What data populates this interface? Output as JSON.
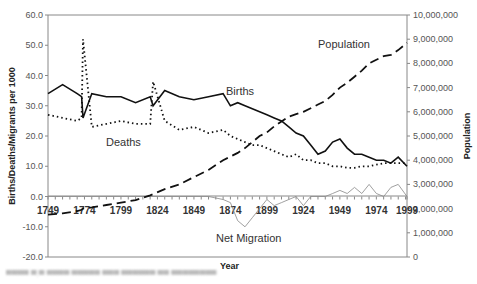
{
  "chart_data": {
    "type": "line",
    "title": "",
    "xlabel": "Year",
    "ylabel": "Births/Deaths/Migrants per 1000",
    "y2label": "Population",
    "xlim": [
      1749,
      1995
    ],
    "ylim": [
      -20,
      60
    ],
    "y2lim": [
      0,
      10000000
    ],
    "grid": false,
    "legend": "none (inline annotations)",
    "x_tick_labels": [
      "1749",
      "1774",
      "1799",
      "1824",
      "1849",
      "1874",
      "1899",
      "1924",
      "1949",
      "1974",
      "1999"
    ],
    "y_tick_labels": [
      "60.0",
      "50.0",
      "40.0",
      "30.0",
      "20.0",
      "10.0",
      "0.0",
      "-10.0",
      "-20.0"
    ],
    "y2_tick_labels": [
      "10,000,000",
      "9,000,000",
      "8,000,000",
      "7,000,000",
      "6,000,000",
      "5,000,000",
      "4,000,000",
      "3,000,000",
      "2,000,000",
      "1,000,000",
      "0"
    ],
    "annotations": [
      "Population",
      "Births",
      "Deaths",
      "Net Migration"
    ],
    "x": [
      1749,
      1759,
      1769,
      1772,
      1773,
      1779,
      1789,
      1799,
      1809,
      1819,
      1821,
      1829,
      1839,
      1849,
      1859,
      1869,
      1874,
      1879,
      1884,
      1889,
      1894,
      1899,
      1904,
      1909,
      1914,
      1919,
      1924,
      1929,
      1934,
      1939,
      1944,
      1949,
      1954,
      1959,
      1964,
      1969,
      1974,
      1979,
      1984,
      1989,
      1995
    ],
    "series": [
      {
        "name": "Births",
        "axis": "left",
        "style": "solid black",
        "values": [
          34,
          37,
          34,
          33,
          26,
          34,
          33,
          33,
          31,
          33,
          30,
          35,
          33,
          32,
          33,
          34,
          30,
          31,
          30,
          29,
          28,
          27,
          26,
          25,
          23,
          21,
          20,
          17,
          14,
          15,
          18,
          19,
          16,
          14,
          14,
          13,
          12,
          12,
          11,
          13,
          10
        ]
      },
      {
        "name": "Deaths",
        "axis": "left",
        "style": "dotted black",
        "values": [
          27,
          26,
          25,
          26,
          52,
          23,
          24,
          25,
          24,
          24,
          38,
          25,
          22,
          23,
          21,
          22,
          20,
          19,
          18,
          17,
          17,
          16,
          15,
          14,
          13,
          14,
          12,
          12,
          11,
          11,
          10,
          10,
          9.5,
          9.5,
          10,
          10,
          10.5,
          11,
          11,
          11,
          11
        ]
      },
      {
        "name": "Net Migration",
        "axis": "left",
        "style": "thin grey",
        "values": [
          0,
          0,
          0,
          0,
          0,
          0,
          0,
          0,
          0,
          0,
          0,
          0,
          0,
          0,
          0,
          -1,
          -2,
          -8,
          -10,
          -7,
          -4,
          -1,
          -3,
          -2,
          -1,
          0,
          -3,
          0,
          0,
          0,
          1,
          2,
          1,
          3,
          1,
          4,
          1,
          0,
          3,
          4,
          0
        ]
      },
      {
        "name": "Population",
        "axis": "right",
        "style": "dashed black",
        "values": [
          1750000,
          1800000,
          1900000,
          1950000,
          2000000,
          2050000,
          2150000,
          2250000,
          2350000,
          2550000,
          2600000,
          2800000,
          3000000,
          3300000,
          3600000,
          4000000,
          4150000,
          4300000,
          4500000,
          4750000,
          5000000,
          5150000,
          5400000,
          5600000,
          5800000,
          5900000,
          6000000,
          6150000,
          6300000,
          6450000,
          6700000,
          7000000,
          7200000,
          7450000,
          7700000,
          8000000,
          8150000,
          8300000,
          8350000,
          8550000,
          8850000
        ]
      }
    ]
  },
  "axes": {
    "left_title": "Births/Deaths/Migrants per 1000",
    "right_title": "Population",
    "x_title": "Year"
  },
  "annotations": {
    "population": "Population",
    "births": "Births",
    "deaths": "Deaths",
    "migration": "Net Migration"
  }
}
